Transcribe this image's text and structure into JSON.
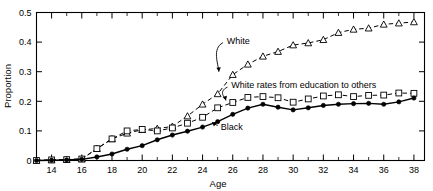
{
  "chart_data": {
    "type": "line",
    "title": "",
    "xlabel": "Age",
    "ylabel": "Proportion",
    "xlim": [
      13,
      38.7
    ],
    "ylim": [
      0,
      0.5
    ],
    "grid": false,
    "legend_position": "inline-annotations",
    "x_ticks_major": [
      14,
      16,
      18,
      20,
      22,
      24,
      26,
      28,
      30,
      32,
      34,
      36,
      38
    ],
    "x_ticks_minor": [
      13,
      15,
      17,
      19,
      21,
      23,
      25,
      27,
      29,
      31,
      33,
      35,
      37
    ],
    "y_ticks": [
      0,
      0.1,
      0.2,
      0.3,
      0.4,
      0.5
    ],
    "y_tick_labels": [
      "0",
      "0.1",
      "0.2",
      "0.3",
      "0.4",
      "0.5"
    ],
    "x_tick_labels": [
      "14",
      "16",
      "18",
      "20",
      "22",
      "24",
      "26",
      "28",
      "30",
      "32",
      "34",
      "36",
      "38"
    ],
    "x": [
      13,
      14,
      15,
      16,
      17,
      18,
      19,
      20,
      21,
      22,
      23,
      24,
      25,
      26,
      27,
      28,
      29,
      30,
      31,
      32,
      33,
      34,
      35,
      36,
      37,
      38
    ],
    "series": [
      {
        "name": "White",
        "marker": "open-triangle",
        "line": "dashed",
        "values": [
          0.0,
          0.002,
          0.003,
          0.005,
          0.04,
          0.073,
          0.092,
          0.104,
          0.108,
          0.115,
          0.15,
          0.19,
          0.225,
          0.29,
          0.325,
          0.352,
          0.368,
          0.39,
          0.397,
          0.408,
          0.432,
          0.443,
          0.447,
          0.46,
          0.464,
          0.468
        ]
      },
      {
        "name": "White rates from education to others",
        "marker": "open-square",
        "line": "dashed",
        "values": [
          0.0,
          0.002,
          0.003,
          0.005,
          0.04,
          0.073,
          0.1,
          0.105,
          0.1,
          0.11,
          0.126,
          0.146,
          0.178,
          0.196,
          0.213,
          0.216,
          0.212,
          0.197,
          0.208,
          0.218,
          0.222,
          0.216,
          0.22,
          0.221,
          0.228,
          0.227
        ]
      },
      {
        "name": "Black",
        "marker": "filled-circle",
        "line": "solid",
        "values": [
          0.0,
          0.001,
          0.002,
          0.004,
          0.012,
          0.022,
          0.038,
          0.05,
          0.07,
          0.086,
          0.099,
          0.113,
          0.131,
          0.156,
          0.177,
          0.19,
          0.18,
          0.171,
          0.178,
          0.186,
          0.19,
          0.192,
          0.193,
          0.19,
          0.198,
          0.211
        ]
      }
    ],
    "annotations": [
      {
        "text": "White",
        "x": 25.6,
        "y": 0.405
      },
      {
        "text": "White rates from education to others",
        "x": 25.9,
        "y": 0.255
      },
      {
        "text": "Black",
        "x": 25.2,
        "y": 0.113
      }
    ]
  }
}
